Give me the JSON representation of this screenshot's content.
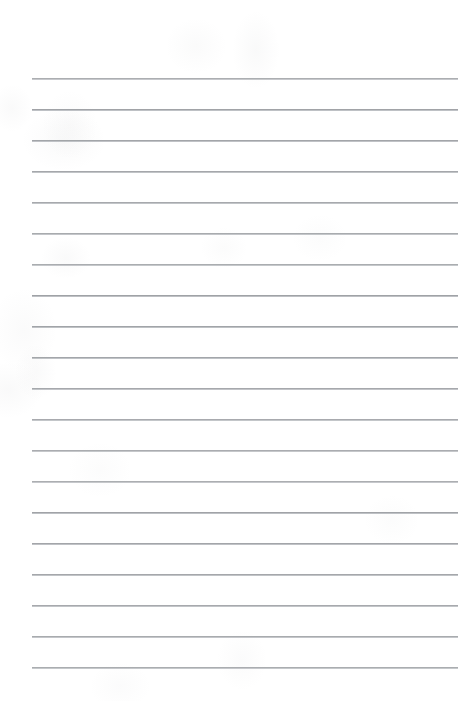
{
  "document": {
    "type": "ruled-paper",
    "title": "Blank Lined Paper",
    "page_width": 474,
    "page_height": 701,
    "background_color": "#ffffff",
    "content_text": ""
  },
  "ruling": {
    "line_color": "#9a9da1",
    "line_secondary_color": "#babdc1",
    "line_thickness_px": 1,
    "line_left_x": 32,
    "line_right_x": 458,
    "line_width_px": 426,
    "first_line_y": 78,
    "line_spacing_px": 31,
    "line_count": 20,
    "lines_y": [
      78,
      109,
      140,
      171,
      202,
      233,
      264,
      295,
      326,
      357,
      388,
      419,
      450,
      481,
      512,
      543,
      574,
      605,
      636,
      667
    ]
  },
  "margins": {
    "left_margin_px": 32,
    "right_margin_px": 16,
    "top_margin_px": 78,
    "bottom_margin_px": 34,
    "has_vertical_margin_rule": false
  }
}
